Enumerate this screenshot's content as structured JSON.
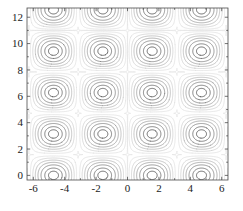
{
  "figure": {
    "background_color": "#ffffff",
    "frame_color": "#4d4d4d",
    "tick_label_color": "#1a1a1a"
  },
  "chart_data": {
    "type": "line",
    "subtype": "contour",
    "title": "",
    "subtitle": "",
    "xlabel": "",
    "ylabel": "",
    "xlim": [
      -6.4,
      6.4
    ],
    "ylim": [
      -0.35,
      12.7
    ],
    "grid": false,
    "legend": null,
    "legend_position": "none",
    "x_ticks": [
      -6,
      -4,
      -2,
      0,
      2,
      4,
      6
    ],
    "x_tick_labels": [
      "-6",
      "-4",
      "-2",
      "0",
      "2",
      "4",
      "6"
    ],
    "y_ticks": [
      0,
      2,
      4,
      6,
      8,
      10,
      12
    ],
    "y_tick_labels": [
      "0",
      "2",
      "4",
      "6",
      "8",
      "10",
      "12"
    ],
    "tick_direction": "in",
    "lattice_period_x": 3.1416,
    "lattice_period_y": 3.1416,
    "peak_centers": [
      [
        -4.71,
        12.57
      ],
      [
        -1.57,
        9.42
      ],
      [
        1.57,
        12.57
      ],
      [
        4.71,
        9.42
      ],
      [
        -4.71,
        6.28
      ],
      [
        -1.57,
        3.14
      ],
      [
        1.57,
        6.28
      ],
      [
        4.71,
        3.14
      ],
      [
        -4.71,
        0.0
      ],
      [
        1.57,
        0.0
      ],
      [
        -1.57,
        15.71
      ],
      [
        4.71,
        15.71
      ]
    ],
    "contour_levels": [
      0.1,
      0.25,
      0.4,
      0.55,
      0.7,
      0.85,
      0.95
    ],
    "contour_line_colors": [
      "#d8d8d8",
      "#c4c4c4",
      "#a8a8a8",
      "#8f8f8f",
      "#757575",
      "#5e5e5e",
      "#4a4a4a"
    ],
    "separatrix_color": "#e2e2e2",
    "series": [
      {
        "name": "level-0.10",
        "level": 0.1,
        "color": "#d8d8d8"
      },
      {
        "name": "level-0.25",
        "level": 0.25,
        "color": "#c4c4c4"
      },
      {
        "name": "level-0.40",
        "level": 0.4,
        "color": "#a8a8a8"
      },
      {
        "name": "level-0.55",
        "level": 0.55,
        "color": "#8f8f8f"
      },
      {
        "name": "level-0.70",
        "level": 0.7,
        "color": "#757575"
      },
      {
        "name": "level-0.85",
        "level": 0.85,
        "color": "#5e5e5e"
      },
      {
        "name": "level-0.95",
        "level": 0.95,
        "color": "#4a4a4a"
      }
    ]
  }
}
